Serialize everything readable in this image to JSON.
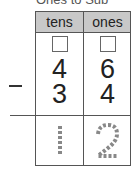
{
  "title": "Ones to Sub",
  "table": {
    "headers": [
      "tens",
      "ones"
    ],
    "regroup_boxes": [
      "",
      ""
    ],
    "minuend": [
      "4",
      "6"
    ],
    "operator": "−",
    "subtrahend": [
      "3",
      "4"
    ],
    "answer": [
      "1",
      "2"
    ]
  },
  "colors": {
    "header_bg": "#c8c8c8",
    "answer_dotted": "#888888"
  }
}
